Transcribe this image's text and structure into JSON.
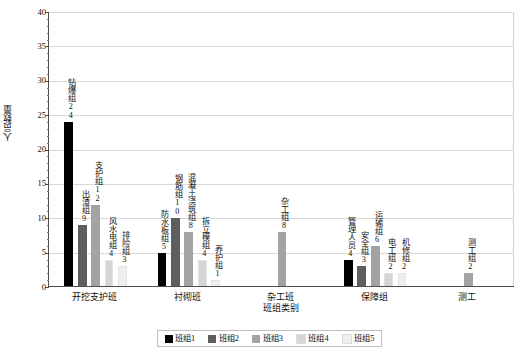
{
  "chart_data": {
    "type": "bar",
    "title": "",
    "xlabel": "班组类别",
    "ylabel": "人员数量",
    "ylim": [
      0,
      40
    ],
    "ytick_labels": [
      "0",
      "5",
      "10",
      "15",
      "20",
      "25",
      "30",
      "35",
      "40"
    ],
    "ytick_values": [
      0,
      5,
      10,
      15,
      20,
      25,
      30,
      35,
      40
    ],
    "grid": "horizontal",
    "legend_position": "bottom",
    "categories": [
      "开挖支护班",
      "衬砌班",
      "杂工班",
      "保障组",
      "测工"
    ],
    "series": [
      {
        "name": "班组1",
        "color": "#000000",
        "values": [
          24,
          5,
          null,
          4,
          null
        ],
        "point_labels": [
          "钻爆组",
          "防水板组",
          null,
          "管理人员",
          null
        ]
      },
      {
        "name": "班组2",
        "color": "#5e5e5e",
        "values": [
          9,
          10,
          null,
          3,
          null
        ],
        "point_labels": [
          "出渣组",
          "钢筋组",
          null,
          "安全组",
          null
        ]
      },
      {
        "name": "班组3",
        "color": "#a3a3a3",
        "values": [
          12,
          8,
          8,
          6,
          2
        ],
        "point_labels": [
          "支护组",
          "混凝土浇筑组",
          "杂工组",
          "运输组",
          "测工组"
        ]
      },
      {
        "name": "班组4",
        "color": "#d5d5d5",
        "values": [
          4,
          4,
          null,
          2,
          null
        ],
        "point_labels": [
          "风水电组",
          "拆立模组",
          null,
          "电工组",
          null
        ]
      },
      {
        "name": "班组5",
        "color": "#efefef",
        "values": [
          3,
          1,
          null,
          2,
          null
        ],
        "point_labels": [
          "排险组",
          "养护组",
          null,
          "机修组",
          null
        ]
      }
    ],
    "data_points": [
      {
        "category": "开挖支护班",
        "series": "班组1",
        "label": "钻爆组",
        "value": 24
      },
      {
        "category": "开挖支护班",
        "series": "班组2",
        "label": "出渣组",
        "value": 9
      },
      {
        "category": "开挖支护班",
        "series": "班组3",
        "label": "支护组",
        "value": 12
      },
      {
        "category": "开挖支护班",
        "series": "班组4",
        "label": "风水电组",
        "value": 4
      },
      {
        "category": "开挖支护班",
        "series": "班组5",
        "label": "排险组",
        "value": 3
      },
      {
        "category": "衬砌班",
        "series": "班组1",
        "label": "防水板组",
        "value": 5
      },
      {
        "category": "衬砌班",
        "series": "班组2",
        "label": "钢筋组",
        "value": 10
      },
      {
        "category": "衬砌班",
        "series": "班组3",
        "label": "混凝土浇筑组",
        "value": 8
      },
      {
        "category": "衬砌班",
        "series": "班组4",
        "label": "拆立模组",
        "value": 4
      },
      {
        "category": "衬砌班",
        "series": "班组5",
        "label": "养护组",
        "value": 1
      },
      {
        "category": "杂工班",
        "series": "班组3",
        "label": "杂工组",
        "value": 8
      },
      {
        "category": "保障组",
        "series": "班组1",
        "label": "管理人员",
        "value": 4
      },
      {
        "category": "保障组",
        "series": "班组2",
        "label": "安全组",
        "value": 3
      },
      {
        "category": "保障组",
        "series": "班组3",
        "label": "运输组",
        "value": 6
      },
      {
        "category": "保障组",
        "series": "班组4",
        "label": "电工组",
        "value": 2
      },
      {
        "category": "保障组",
        "series": "班组5",
        "label": "机修组",
        "value": 2
      },
      {
        "category": "测工",
        "series": "班组3",
        "label": "测工组",
        "value": 2
      }
    ]
  },
  "axis": {
    "y_title": "人员数量",
    "x_title": "班组类别"
  },
  "legend": {
    "items": [
      {
        "label": "班组1",
        "color": "#000000"
      },
      {
        "label": "班组2",
        "color": "#5e5e5e"
      },
      {
        "label": "班组3",
        "color": "#a3a3a3"
      },
      {
        "label": "班组4",
        "color": "#d5d5d5"
      },
      {
        "label": "班组5",
        "color": "#efefef"
      }
    ]
  }
}
